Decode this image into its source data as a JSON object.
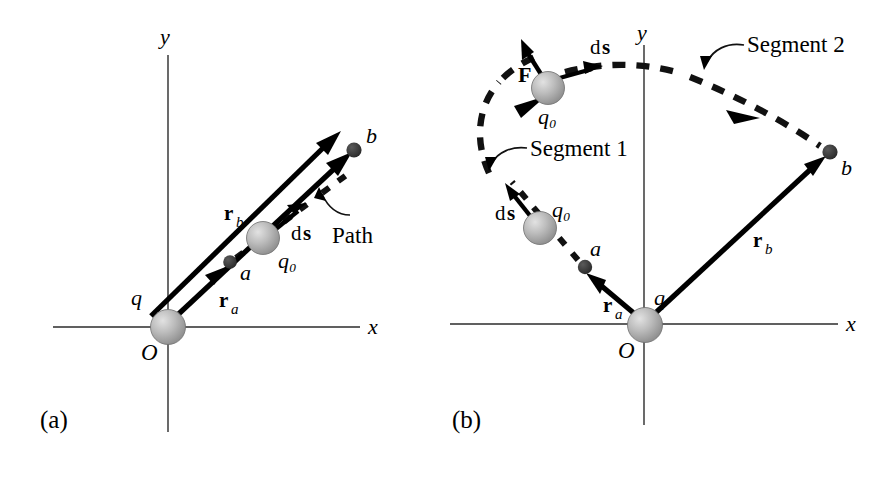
{
  "figure": {
    "background_color": "#ffffff",
    "ink_color": "#000000",
    "sphere_fill": "#b8b8b8"
  },
  "panels": [
    {
      "tag": "(a)",
      "description": "Test charge q0 moves radially outward from a to b along a straight line through the point charge q",
      "axes": {
        "x_label": "x",
        "y_label": "y",
        "origin_label": "O"
      },
      "labels": {
        "source_charge": "q",
        "test_charge": "q₀",
        "point_a": "a",
        "point_b": "b",
        "vector_ra": "r",
        "vector_ra_sub": "a",
        "vector_rb": "r",
        "vector_rb_sub": "b",
        "displacement": "d",
        "displacement_bold": "s",
        "path_callout": "Path"
      }
    },
    {
      "tag": "(b)",
      "description": "Test charge q0 moves from a to b along an arbitrary two-segment path; Segment 1 is radial-ish, Segment 2 is along an arc",
      "axes": {
        "x_label": "x",
        "y_label": "y",
        "origin_label": "O"
      },
      "labels": {
        "source_charge": "q",
        "test_charge_lower": "q₀",
        "test_charge_upper": "q₀",
        "point_a": "a",
        "point_b": "b",
        "vector_ra": "r",
        "vector_ra_sub": "a",
        "vector_rb": "r",
        "vector_rb_sub": "b",
        "displacement_lower": "d",
        "displacement_lower_bold": "s",
        "displacement_upper": "d",
        "displacement_upper_bold": "s",
        "force": "F",
        "segment_1_callout": "Segment 1",
        "segment_2_callout": "Segment 2"
      }
    }
  ],
  "icons": {
    "sphere": "shaded-sphere-icon",
    "arrow": "vector-arrow-icon",
    "dot": "point-marker-icon",
    "dashed_curve": "dashed-path-icon",
    "leader_arrow": "callout-leader-arrow-icon"
  }
}
